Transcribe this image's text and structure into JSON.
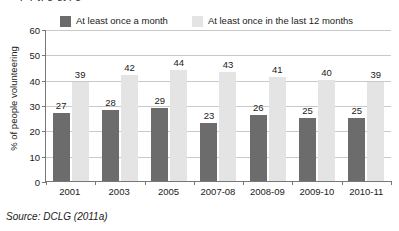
{
  "clipped_title_fragment": "sepqkjpg gypg",
  "legend": {
    "items": [
      {
        "label": "At least once a month",
        "color": "#6c6c6c",
        "swatch_name": "legend-swatch-dark"
      },
      {
        "label": "At least once in the last 12 months",
        "color": "#e4e4e4",
        "swatch_name": "legend-swatch-light"
      }
    ]
  },
  "source": "Source: DCLG (2011a)",
  "chart_data": {
    "type": "bar",
    "title": "",
    "xlabel": "",
    "ylabel": "% of people volunteering",
    "ylim": [
      0,
      60
    ],
    "yticks": [
      0,
      10,
      20,
      30,
      40,
      50,
      60
    ],
    "grid": true,
    "legend_position": "top",
    "categories": [
      "2001",
      "2003",
      "2005",
      "2007-08",
      "2008-09",
      "2009-10",
      "2010-11"
    ],
    "series": [
      {
        "name": "At least once a month",
        "color": "#6c6c6c",
        "values": [
          27,
          28,
          29,
          23,
          26,
          25,
          25
        ]
      },
      {
        "name": "At least once in the last 12 months",
        "color": "#e4e4e4",
        "values": [
          39,
          42,
          44,
          43,
          41,
          40,
          39
        ]
      }
    ]
  }
}
